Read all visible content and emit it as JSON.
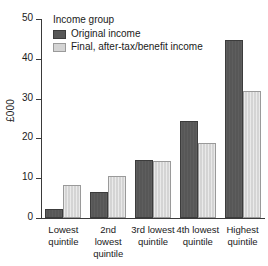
{
  "chart_data": {
    "type": "bar",
    "title": "",
    "xlabel": "",
    "ylabel": "£000",
    "ylim": [
      0,
      50
    ],
    "yticks": [
      0,
      10,
      20,
      30,
      40,
      50
    ],
    "grid": false,
    "legend_position": "top-left",
    "legend_title": "Income group",
    "categories": [
      "Lowest quintile",
      "2nd lowest quintile",
      "3rd lowest quintile",
      "4th lowest quintile",
      "Highest quintile"
    ],
    "category_lines": [
      [
        "Lowest",
        "quintile"
      ],
      [
        "2nd lowest",
        "quintile"
      ],
      [
        "3rd lowest",
        "quintile"
      ],
      [
        "4th lowest",
        "quintile"
      ],
      [
        "Highest",
        "quintile"
      ]
    ],
    "series": [
      {
        "name": "Original income",
        "color": "#575757",
        "values": [
          2.2,
          6.5,
          14.6,
          24.4,
          44.7
        ]
      },
      {
        "name": "Final, after-tax/benefit income",
        "color": "#d4d4d4",
        "values": [
          8.3,
          10.6,
          14.3,
          18.9,
          31.8
        ]
      }
    ]
  },
  "colors": {
    "original_income": "#575757",
    "final_income": "#d4d4d4",
    "axis": "#3a3a3a",
    "text": "#1a1a1a",
    "background": "#ffffff"
  }
}
